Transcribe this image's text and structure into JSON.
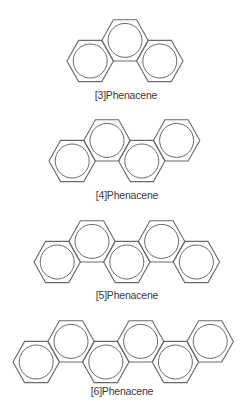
{
  "figure": {
    "line_color": "#6a6a6a",
    "text_color": "#3a3a3a",
    "geometry": {
      "hex_half_width": 23.2,
      "hex_half_height": 20.6,
      "inner_circle_radius": 17
    },
    "molecules": [
      {
        "id": "phenacene-3",
        "label": "[3]Phenacene",
        "ring_count": 3,
        "left_vertex_x": 67,
        "lower_row_cy": 61,
        "label_center_x": 126,
        "label_baseline_y": 99
      },
      {
        "id": "phenacene-4",
        "label": "[4]Phenacene",
        "ring_count": 4,
        "left_vertex_x": 49,
        "lower_row_cy": 161,
        "label_center_x": 127,
        "label_baseline_y": 199
      },
      {
        "id": "phenacene-5",
        "label": "[5]Phenacene",
        "ring_count": 5,
        "left_vertex_x": 34,
        "lower_row_cy": 262,
        "label_center_x": 127,
        "label_baseline_y": 299
      },
      {
        "id": "phenacene-6",
        "label": "[6]Phenacene",
        "ring_count": 6,
        "left_vertex_x": 13,
        "lower_row_cy": 362,
        "label_center_x": 122,
        "label_baseline_y": 395
      }
    ]
  }
}
